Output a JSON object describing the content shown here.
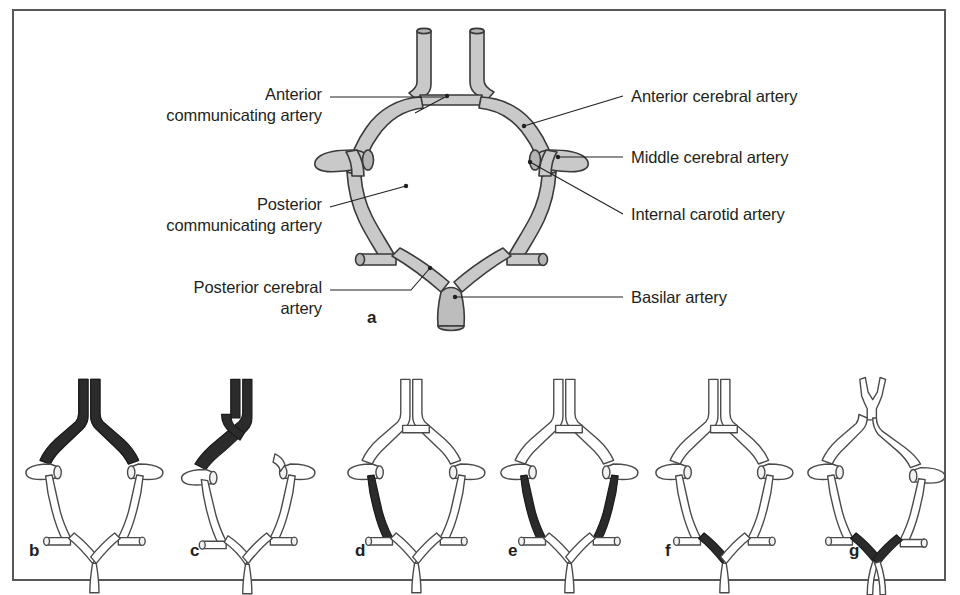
{
  "figure": {
    "frame_border_color": "#58585a",
    "vessel_fill_color": "#c9c9c9",
    "vessel_outline_color": "#3a3a3a",
    "highlight_color": "#2b2b2b",
    "background_color": "#ffffff"
  },
  "panel_a": {
    "letter": "a",
    "labels_left": [
      {
        "id": "anterior-communicating-artery",
        "text": "Anterior\ncommunicating artery"
      },
      {
        "id": "posterior-communicating-artery",
        "text": "Posterior\ncommunicating artery"
      },
      {
        "id": "posterior-cerebral-artery",
        "text": "Posterior cerebral\nartery"
      }
    ],
    "labels_right": [
      {
        "id": "anterior-cerebral-artery",
        "text": "Anterior cerebral artery"
      },
      {
        "id": "middle-cerebral-artery",
        "text": "Middle cerebral artery"
      },
      {
        "id": "internal-carotid-artery",
        "text": "Internal carotid artery"
      },
      {
        "id": "basilar-artery",
        "text": "Basilar artery"
      }
    ]
  },
  "variants": [
    {
      "letter": "b",
      "id": "variant-b",
      "highlight": "both-a1-segments-hypoplastic-variant"
    },
    {
      "letter": "c",
      "id": "variant-c",
      "highlight": "unilateral-a1-origin-both-aca"
    },
    {
      "letter": "d",
      "id": "variant-d",
      "highlight": "left-posterior-communicating-artery"
    },
    {
      "letter": "e",
      "id": "variant-e",
      "highlight": "bilateral-posterior-communicating-arteries"
    },
    {
      "letter": "f",
      "id": "variant-f",
      "highlight": "left-p1-fetal-origin"
    },
    {
      "letter": "g",
      "id": "variant-g",
      "highlight": "bilateral-p1-with-azygos-aca"
    }
  ]
}
